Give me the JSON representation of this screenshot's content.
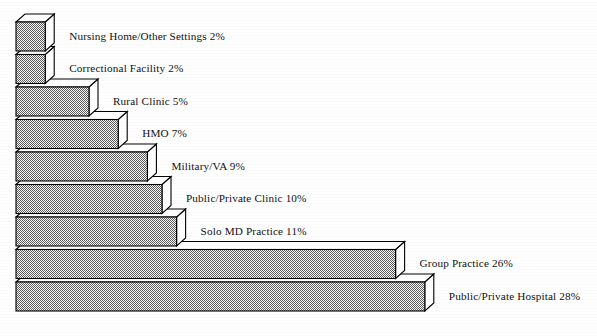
{
  "chart_data": {
    "type": "bar",
    "orientation": "horizontal",
    "style": "3d-extruded",
    "title": "",
    "subtitle": "",
    "xlabel": "",
    "ylabel": "",
    "grid": false,
    "legend": false,
    "axis_visible": false,
    "value_unit": "%",
    "xlim": [
      0,
      28
    ],
    "categories": [
      "Nursing Home/Other Settings",
      "Correctional Facility",
      "Rural Clinic",
      "HMO",
      "Military/VA",
      "Public/Private Clinic",
      "Solo MD Practice",
      "Group Practice",
      "Public/Private Hospital"
    ],
    "values": [
      2,
      2,
      5,
      7,
      9,
      10,
      11,
      26,
      28
    ],
    "labels": [
      "Nursing Home/Other Settings 2%",
      "Correctional Facility 2%",
      "Rural Clinic 5%",
      "HMO 7%",
      "Military/VA 9%",
      "Public/Private Clinic 10%",
      "Solo MD Practice 11%",
      "Group Practice 26%",
      "Public/Private Hospital 28%"
    ],
    "colors": {
      "bar_face": "#808080",
      "bar_top": "#ffffff",
      "bar_side": "#ffffff",
      "outline": "#000000",
      "text": "#111111",
      "background": "#ffffff"
    }
  },
  "geometry": {
    "origin_x": 16,
    "first_bar_top_y": 22,
    "bar_height": 29,
    "bar_gap": 3.5,
    "px_per_percent": 14.6,
    "depth_x": 9,
    "depth_y": 8,
    "label_offset_x": 15
  }
}
